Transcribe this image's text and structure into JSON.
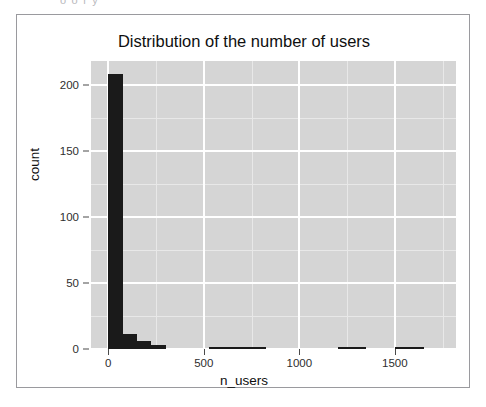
{
  "clipped_top_text": "o   o   r  y",
  "chart_data": {
    "type": "bar",
    "title": "Distribution of the number of users",
    "xlabel": "n_users",
    "ylabel": "count",
    "xlim": [
      -90,
      1820
    ],
    "ylim": [
      0,
      218
    ],
    "grid": true,
    "legend": "none",
    "bin_width": 75,
    "xticks": [
      0,
      500,
      1000,
      1500
    ],
    "xtick_labels": [
      "0",
      "500",
      "1000",
      "1500"
    ],
    "yticks": [
      0,
      50,
      100,
      150,
      200
    ],
    "ytick_labels": [
      "0",
      "50",
      "100",
      "150",
      "200"
    ],
    "x_minor_ticks": [
      250,
      750,
      1250,
      1750
    ],
    "y_minor_ticks": [
      25,
      75,
      125,
      175
    ],
    "bar_color": "#1a1a1a",
    "panel_color": "#d5d5d5",
    "gridline_color": "#ffffff",
    "bins": [
      {
        "x0": 0,
        "x1": 75,
        "count": 208
      },
      {
        "x0": 75,
        "x1": 150,
        "count": 11
      },
      {
        "x0": 150,
        "x1": 225,
        "count": 6
      },
      {
        "x0": 225,
        "x1": 300,
        "count": 3
      },
      {
        "x0": 300,
        "x1": 375,
        "count": 0
      },
      {
        "x0": 375,
        "x1": 450,
        "count": 0
      },
      {
        "x0": 450,
        "x1": 525,
        "count": 0
      },
      {
        "x0": 525,
        "x1": 600,
        "count": 1
      },
      {
        "x0": 600,
        "x1": 675,
        "count": 1
      },
      {
        "x0": 675,
        "x1": 750,
        "count": 1
      },
      {
        "x0": 750,
        "x1": 825,
        "count": 1
      },
      {
        "x0": 825,
        "x1": 900,
        "count": 0
      },
      {
        "x0": 900,
        "x1": 975,
        "count": 0
      },
      {
        "x0": 975,
        "x1": 1050,
        "count": 0
      },
      {
        "x0": 1050,
        "x1": 1125,
        "count": 0
      },
      {
        "x0": 1125,
        "x1": 1200,
        "count": 0
      },
      {
        "x0": 1200,
        "x1": 1275,
        "count": 1
      },
      {
        "x0": 1275,
        "x1": 1350,
        "count": 1
      },
      {
        "x0": 1350,
        "x1": 1425,
        "count": 0
      },
      {
        "x0": 1425,
        "x1": 1500,
        "count": 0
      },
      {
        "x0": 1500,
        "x1": 1575,
        "count": 1
      },
      {
        "x0": 1575,
        "x1": 1650,
        "count": 1
      },
      {
        "x0": 1650,
        "x1": 1725,
        "count": 0
      }
    ]
  }
}
